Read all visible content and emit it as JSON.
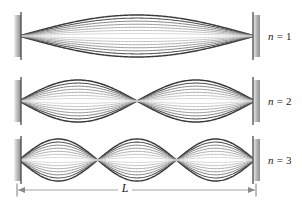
{
  "figure": {
    "width": 302,
    "height": 210,
    "background_color": "#ffffff"
  },
  "colors": {
    "curve_darkest": "#3a3a3a",
    "curve_mid": "#8c8c8c",
    "curve_lightest": "#c9c9c9",
    "wall_light": "#e2e2e2",
    "wall_dark": "#8f8f8f",
    "wall_edge": "#4a4a4a",
    "dimension_line": "#9a9a9a",
    "text": "#1a1a1a"
  },
  "geometry": {
    "wall_left_x": 14,
    "wall_right_x": 253,
    "wall_width": 7,
    "wall_height": 42,
    "string_left_x": 19,
    "string_right_x": 255,
    "curve_count": 7
  },
  "panels": [
    {
      "id": "panel-n1",
      "harmonic": 1,
      "label": "n = 1",
      "label_prefix": "n",
      "label_equals": "=",
      "label_value": "1",
      "antinodes": 1,
      "nodes_interior": 0,
      "axis_y": 36,
      "amplitude": 21,
      "label_x": 268,
      "label_y": 30
    },
    {
      "id": "panel-n2",
      "harmonic": 2,
      "label": "n = 2",
      "label_prefix": "n",
      "label_equals": "=",
      "label_value": "2",
      "antinodes": 2,
      "nodes_interior": 1,
      "axis_y": 101,
      "amplitude": 21,
      "label_x": 268,
      "label_y": 95
    },
    {
      "id": "panel-n3",
      "harmonic": 3,
      "label": "n = 3",
      "label_prefix": "n",
      "label_equals": "=",
      "label_value": "3",
      "antinodes": 3,
      "nodes_interior": 2,
      "axis_y": 160,
      "amplitude": 21,
      "label_x": 268,
      "label_y": 154
    }
  ],
  "dimension": {
    "label": "L",
    "y": 190,
    "x_start": 17,
    "x_end": 256,
    "tick_height": 13,
    "label_x": 125,
    "label_y": 181
  }
}
